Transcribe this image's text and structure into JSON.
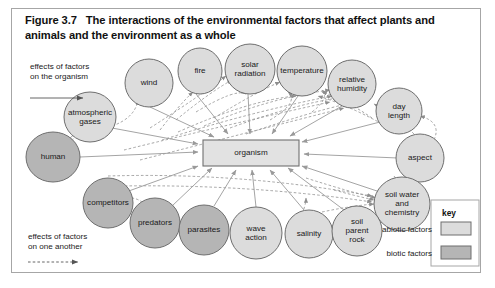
{
  "figure": {
    "number": "Figure 3.7",
    "title": "The interactions of the environmental factors that affect plants and animals and the environment as a whole"
  },
  "center": {
    "label": "organism"
  },
  "legend_left": {
    "to_organism": "effects of factors\non the organism",
    "to_each_other": "effects of factors\non one another"
  },
  "key": {
    "title": "key",
    "items": [
      {
        "label": "abiotic factors",
        "color": "#dcdcdc"
      },
      {
        "label": "biotic factors",
        "color": "#b5b5b5"
      }
    ]
  },
  "colors": {
    "abiotic_fill": "#dcdcdc",
    "biotic_fill": "#b5b5b5",
    "node_stroke": "#6e6e6e",
    "center_fill": "#e2e2e2",
    "center_stroke": "#707070",
    "arrow_solid": "#9a9a9a",
    "arrow_dashed": "#8e8e8e",
    "frame_stroke": "#a6a6a6"
  },
  "nodes": [
    {
      "name": "atmospheric-gases",
      "label": "atmospheric\ngases",
      "type": "abiotic",
      "cx": 90,
      "cy": 117,
      "rx": 26,
      "ry": 25
    },
    {
      "name": "wind",
      "label": "wind",
      "type": "abiotic",
      "cx": 149,
      "cy": 83,
      "rx": 24,
      "ry": 24
    },
    {
      "name": "fire",
      "label": "fire",
      "type": "abiotic",
      "cx": 200,
      "cy": 71,
      "rx": 22,
      "ry": 23
    },
    {
      "name": "solar-radiation",
      "label": "solar\nradiation",
      "type": "abiotic",
      "cx": 250,
      "cy": 69,
      "rx": 25,
      "ry": 25
    },
    {
      "name": "temperature",
      "label": "temperature",
      "type": "abiotic",
      "cx": 302,
      "cy": 71,
      "rx": 25,
      "ry": 25
    },
    {
      "name": "relative-humidity",
      "label": "relative\nhumidity",
      "type": "abiotic",
      "cx": 352,
      "cy": 84,
      "rx": 24,
      "ry": 24
    },
    {
      "name": "day-length",
      "label": "day\nlength",
      "type": "abiotic",
      "cx": 399,
      "cy": 111,
      "rx": 23,
      "ry": 23
    },
    {
      "name": "aspect",
      "label": "aspect",
      "type": "abiotic",
      "cx": 420,
      "cy": 158,
      "rx": 24,
      "ry": 24
    },
    {
      "name": "soil-water-chemistry",
      "label": "soil water\nand\nchemistry",
      "type": "abiotic",
      "cx": 402,
      "cy": 204,
      "rx": 28,
      "ry": 27
    },
    {
      "name": "human",
      "label": "human",
      "type": "biotic",
      "cx": 53,
      "cy": 157,
      "rx": 27,
      "ry": 25
    },
    {
      "name": "competitors",
      "label": "competitors",
      "type": "biotic",
      "cx": 108,
      "cy": 203,
      "rx": 25,
      "ry": 25
    },
    {
      "name": "predators",
      "label": "predators",
      "type": "biotic",
      "cx": 155,
      "cy": 223,
      "rx": 25,
      "ry": 25
    },
    {
      "name": "parasites",
      "label": "parasites",
      "type": "biotic",
      "cx": 204,
      "cy": 230,
      "rx": 25,
      "ry": 25
    },
    {
      "name": "wave-action",
      "label": "wave\naction",
      "type": "abiotic",
      "cx": 256,
      "cy": 233,
      "rx": 26,
      "ry": 26
    },
    {
      "name": "salinity",
      "label": "salinity",
      "type": "abiotic",
      "cx": 309,
      "cy": 234,
      "rx": 24,
      "ry": 24
    },
    {
      "name": "soil-parent-rock",
      "label": "soil\nparent\nrock",
      "type": "abiotic",
      "cx": 357,
      "cy": 231,
      "rx": 25,
      "ry": 25
    }
  ],
  "center_box": {
    "x": 203,
    "y": 140,
    "w": 96,
    "h": 26
  }
}
